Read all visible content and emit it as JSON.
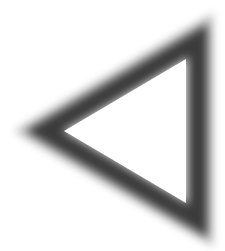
{
  "image": {
    "subject": "left-pointing triangle outline",
    "icon": "triangle-left-outline-icon",
    "style": "soft blurred dark stroke on white",
    "colors": {
      "background": "#ffffff",
      "stroke": "#3a3a3a",
      "fill": "#ffffff"
    }
  }
}
